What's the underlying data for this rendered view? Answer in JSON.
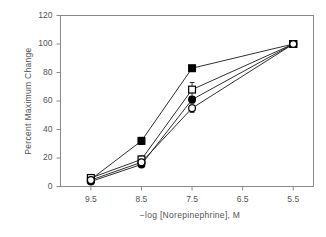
{
  "chart_data": {
    "type": "line",
    "title": "",
    "subtitle": "",
    "xlabel": "−log [Norepinephrine], M",
    "ylabel": "Percent Maximum Change",
    "x": [
      9.5,
      8.5,
      7.5,
      5.5
    ],
    "xtick_labels": [
      "9.5",
      "8.5",
      "7.5",
      "6.5",
      "5.5"
    ],
    "xticks": [
      9.5,
      8.5,
      7.5,
      6.5,
      5.5
    ],
    "xlim": [
      10.1,
      5.1
    ],
    "x_axis_inverted": true,
    "ytick_labels": [
      "0",
      "20",
      "40",
      "60",
      "80",
      "100",
      "120"
    ],
    "yticks": [
      0,
      20,
      40,
      60,
      80,
      100,
      120
    ],
    "ylim": [
      0,
      120
    ],
    "grid": false,
    "legend_position": "none",
    "series": [
      {
        "name": "filled-square",
        "marker": "filled-square",
        "color": "#000000",
        "filled": true,
        "values": [
          5,
          32,
          83,
          100
        ],
        "errors": [
          1.5,
          2.5,
          0,
          1.5
        ]
      },
      {
        "name": "open-square",
        "marker": "open-square",
        "color": "#000000",
        "filled": false,
        "values": [
          6,
          19,
          68,
          100
        ],
        "errors": [
          1.5,
          2.5,
          5,
          1.5
        ]
      },
      {
        "name": "filled-circle",
        "marker": "filled-circle",
        "color": "#000000",
        "filled": true,
        "values": [
          3.5,
          15.5,
          61,
          100
        ],
        "errors": [
          1.5,
          2,
          2,
          1.5
        ]
      },
      {
        "name": "open-circle",
        "marker": "open-circle",
        "color": "#000000",
        "filled": false,
        "values": [
          4.5,
          17,
          55,
          100
        ],
        "errors": [
          1.5,
          2,
          3,
          1.5
        ]
      }
    ]
  },
  "style": {
    "axis_color": "#8a8a8a",
    "text_color": "#545454",
    "line_color": "#1a1a1a",
    "marker_color": "#000000",
    "background": "#ffffff"
  }
}
